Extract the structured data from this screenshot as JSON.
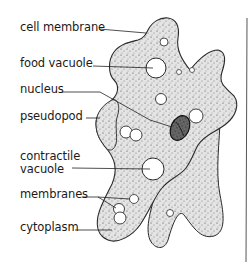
{
  "diagram": {
    "labels": [
      {
        "id": "cell-membrane",
        "text": "cell membrane",
        "x": 20,
        "y": 21
      },
      {
        "id": "food-vacuole",
        "text": "food vacuole",
        "x": 20,
        "y": 57
      },
      {
        "id": "nucleus",
        "text": "nucleus",
        "x": 20,
        "y": 83
      },
      {
        "id": "pseudopod",
        "text": "pseudopod",
        "x": 20,
        "y": 110
      },
      {
        "id": "contractile-vacuole-1",
        "text": "contractile",
        "x": 20,
        "y": 150
      },
      {
        "id": "contractile-vacuole-2",
        "text": "vacuole",
        "x": 20,
        "y": 163
      },
      {
        "id": "membranes",
        "text": "membranes",
        "x": 20,
        "y": 188
      },
      {
        "id": "cytoplasm",
        "text": "cytoplasm",
        "x": 20,
        "y": 221
      }
    ],
    "colors": {
      "ink": "#1a1a1a",
      "cytoplasm_fill": "#dcdcdc",
      "nucleus_fill": "#555555",
      "background": "#ffffff"
    }
  }
}
